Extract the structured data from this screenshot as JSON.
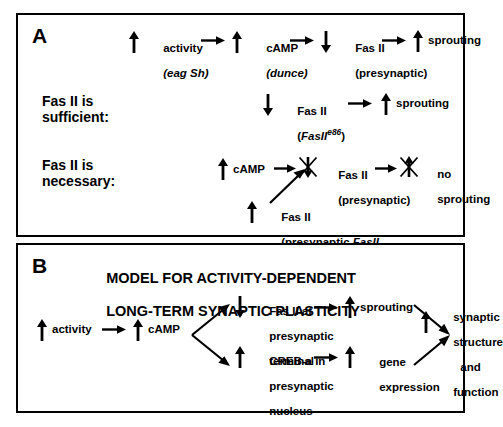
{
  "figure": {
    "panels": [
      {
        "id": "A",
        "letter": "A",
        "rows": [
          {
            "id": "row-activity-cascade",
            "row_label": "",
            "nodes": [
              {
                "arrow": "up",
                "text": "activity",
                "sub": "(eag Sh)",
                "sub_italic": true
              },
              {
                "arrow": "up",
                "text": "cAMP",
                "sub": "(dunce)",
                "sub_italic": true
              },
              {
                "arrow": "down",
                "text": "Fas II",
                "sub": "(presynaptic)",
                "sub_italic": false
              },
              {
                "arrow": "up",
                "text": "sprouting",
                "sub": "",
                "sub_italic": false
              }
            ]
          },
          {
            "id": "row-sufficient",
            "row_label": "Fas II is\nsufficient:",
            "nodes": [
              {
                "arrow": "down",
                "text": "Fas II",
                "sub": "(FasII e86)",
                "sub_italic": true
              },
              {
                "arrow": "up",
                "text": "sprouting",
                "sub": "",
                "sub_italic": false
              }
            ]
          },
          {
            "id": "row-necessary",
            "row_label": "Fas II is\nnecessary:",
            "nodes": [
              {
                "arrow": "up",
                "text": "cAMP",
                "sub": "",
                "sub_italic": false
              },
              {
                "arrow": "down-crossed",
                "text": "Fas II",
                "sub": "(presynaptic)",
                "sub_italic": false
              },
              {
                "arrow": "up-crossed",
                "text": "no",
                "sub": "sprouting",
                "sub_italic": false
              }
            ],
            "transgene": {
              "arrow": "up",
              "line1": "Fas II",
              "line2": "(presynaptic FasII",
              "line2_italic_part": "FasII",
              "line3": "transgene)"
            }
          }
        ]
      },
      {
        "id": "B",
        "letter": "B",
        "title_line1": "MODEL FOR ACTIVITY-DEPENDENT",
        "title_line2": "LONG-TERM SYNAPTIC PLASTICITY",
        "nodes": {
          "activity": {
            "arrow": "up",
            "text": "activity"
          },
          "camp": {
            "arrow": "up",
            "text": "cAMP"
          },
          "branch_upper": {
            "arrow": "down",
            "line1": "Fas II at",
            "line2": "presynaptic",
            "line3": "terminal"
          },
          "branch_lower": {
            "arrow": "up",
            "line1": "CREB-a in",
            "line2": "presynaptic",
            "line3": "nucleus"
          },
          "out_upper": {
            "arrow": "up",
            "text": "sprouting"
          },
          "out_lower": {
            "arrow": "up",
            "line1": "gene",
            "line2": "expression"
          },
          "result": {
            "arrow": "up",
            "line1": "synaptic",
            "line2": "structure",
            "line3": "and",
            "line4": "function"
          }
        }
      }
    ]
  },
  "colors": {
    "ink": "#000000",
    "background": "#ffffff",
    "border": "#000000"
  }
}
